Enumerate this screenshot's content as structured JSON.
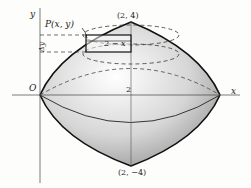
{
  "figure": {
    "axis_labels": {
      "x": "x",
      "y": "y",
      "origin": "O"
    },
    "tick_label": "2",
    "point_labels": {
      "top": "(2, 4)",
      "bottom": "(2, −4)",
      "P": "P(x, y)"
    },
    "annotations": {
      "width": "2 − x",
      "delta_y": "Δy"
    },
    "colors": {
      "line": "#111111",
      "shade_light": "#f4f4f4",
      "shade_dark": "#9a9a9a"
    }
  }
}
